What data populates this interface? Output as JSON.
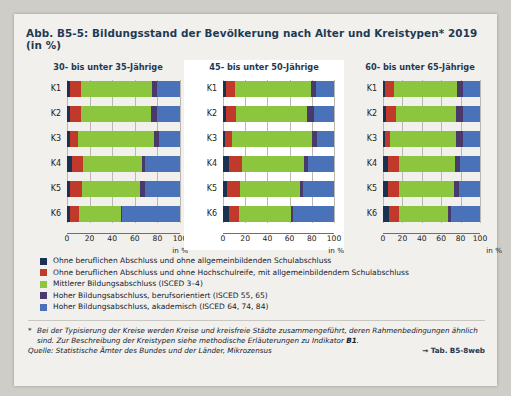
{
  "title": "Abb. B5-5: Bildungsstand der Bevölkerung nach Alter und Kreistypen* 2019 (in %)",
  "axis": {
    "unit": "in %",
    "ticks": [
      "0",
      "20",
      "40",
      "60",
      "80",
      "100"
    ],
    "tick_values": [
      0,
      20,
      40,
      60,
      80,
      100
    ]
  },
  "categories": [
    "K1",
    "K2",
    "K3",
    "K4",
    "K5",
    "K6"
  ],
  "legend": [
    {
      "color": "#1b3152",
      "label": "Ohne beruflichen Abschluss und ohne allgemeinbildenden Schulabschluss"
    },
    {
      "color": "#c0392b",
      "label": "Ohne beruflichen Abschluss und ohne Hochschulreife, mit allgemeinbildendem Schulabschluss"
    },
    {
      "color": "#8cc63f",
      "label": "Mittlerer Bildungsabschluss (ISCED 3–4)"
    },
    {
      "color": "#4a3a6b",
      "label": "Hoher Bildungsabschluss, berufsorientiert (ISCED 55, 65)"
    },
    {
      "color": "#4a72b8",
      "label": "Hoher Bildungsabschluss, akademisch (ISCED 64, 74, 84)"
    }
  ],
  "footnote_marker": "*",
  "footnote": "Bei der Typisierung der Kreise werden Kreise und kreisfreie Städte zusammengeführt, deren Rahmenbedingungen ähnlich sind. Zur Beschreibung der Kreistypen siehe methodische Erläuterungen zu Indikator ",
  "footnote_bold": "B1",
  "footnote_end": ".",
  "source": "Quelle: Statistische Ämter des Bundes und der Länder, Mikrozensus",
  "table_ref": "→ Tab. B5-8web",
  "chart_data": {
    "type": "bar",
    "orientation": "horizontal",
    "stacked": true,
    "title": "Bildungsstand der Bevölkerung nach Alter und Kreistypen* 2019 (in %)",
    "xlabel": "in %",
    "ylabel": "",
    "xlim": [
      0,
      100
    ],
    "grid": true,
    "legend_position": "below",
    "categories": [
      "K1",
      "K2",
      "K3",
      "K4",
      "K5",
      "K6"
    ],
    "series_names": [
      "Ohne beruflichen Abschluss und ohne allgemeinbildenden Schulabschluss",
      "Ohne beruflichen Abschluss und ohne Hochschulreife, mit allgemeinbildendem Schulabschluss",
      "Mittlerer Bildungsabschluss (ISCED 3–4)",
      "Hoher Bildungsabschluss, berufsorientiert (ISCED 55, 65)",
      "Hoher Bildungsabschluss, akademisch (ISCED 64, 74, 84)"
    ],
    "panels": [
      {
        "title": "30- bis unter 35-Jährige",
        "rows": [
          {
            "category": "K1",
            "values": [
              3,
              9,
              63,
              5,
              20
            ]
          },
          {
            "category": "K2",
            "values": [
              3,
              9,
              62,
              6,
              20
            ]
          },
          {
            "category": "K3",
            "values": [
              3,
              7,
              67,
              4,
              19
            ]
          },
          {
            "category": "K4",
            "values": [
              4,
              10,
              52,
              3,
              31
            ]
          },
          {
            "category": "K5",
            "values": [
              3,
              10,
              52,
              4,
              31
            ]
          },
          {
            "category": "K6",
            "values": [
              3,
              8,
              37,
              1,
              51
            ]
          }
        ]
      },
      {
        "title": "45- bis unter 50-Jährige",
        "rows": [
          {
            "category": "K1",
            "values": [
              3,
              8,
              68,
              5,
              16
            ]
          },
          {
            "category": "K2",
            "values": [
              3,
              9,
              64,
              6,
              18
            ]
          },
          {
            "category": "K3",
            "values": [
              2,
              6,
              72,
              5,
              15
            ]
          },
          {
            "category": "K4",
            "values": [
              5,
              12,
              56,
              4,
              23
            ]
          },
          {
            "category": "K5",
            "values": [
              4,
              11,
              54,
              3,
              28
            ]
          },
          {
            "category": "K6",
            "values": [
              5,
              9,
              47,
              2,
              37
            ]
          }
        ]
      },
      {
        "title": "60- bis unter 65-Jährige",
        "rows": [
          {
            "category": "K1",
            "values": [
              2,
              9,
              65,
              6,
              18
            ]
          },
          {
            "category": "K2",
            "values": [
              3,
              10,
              62,
              7,
              18
            ]
          },
          {
            "category": "K3",
            "values": [
              2,
              5,
              68,
              8,
              17
            ]
          },
          {
            "category": "K4",
            "values": [
              5,
              11,
              58,
              5,
              21
            ]
          },
          {
            "category": "K5",
            "values": [
              5,
              11,
              57,
              5,
              22
            ]
          },
          {
            "category": "K6",
            "values": [
              6,
              10,
              51,
              3,
              30
            ]
          }
        ]
      }
    ]
  }
}
